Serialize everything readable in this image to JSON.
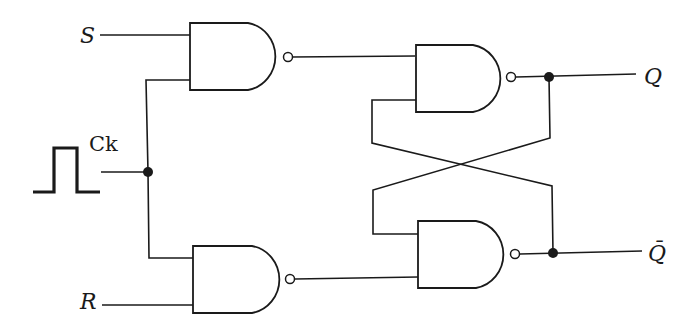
{
  "diagram": {
    "colors": {
      "ink": "#1a1a1a",
      "background": "#ffffff"
    },
    "labels": {
      "s_input": "S",
      "r_input": "R",
      "clock": "Ck",
      "q_output": "Q",
      "q_bar_output": "Q̄"
    },
    "gates": [
      {
        "id": "nand-s",
        "type": "NAND",
        "inputs": [
          "S",
          "Ck"
        ]
      },
      {
        "id": "nand-r",
        "type": "NAND",
        "inputs": [
          "Ck",
          "R"
        ]
      },
      {
        "id": "nand-q",
        "type": "NAND",
        "inputs": [
          "nand-s",
          "Q̄"
        ],
        "output": "Q"
      },
      {
        "id": "nand-qbar",
        "type": "NAND",
        "inputs": [
          "Q",
          "nand-r"
        ],
        "output": "Q̄"
      }
    ],
    "clock_signal": "pulse-icon"
  }
}
